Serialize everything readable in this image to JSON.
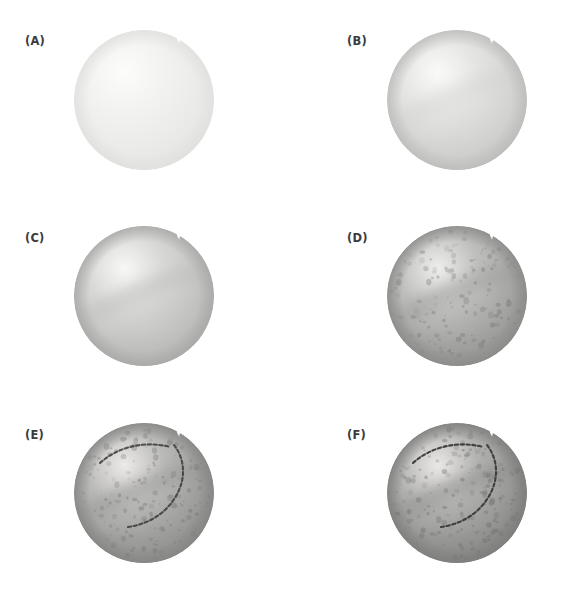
{
  "figure": {
    "kind": "step-by-step-painting-demonstration",
    "medium": "watercolor / grayscale wash",
    "background_color": "#ffffff",
    "label_color": "#3b3b3b",
    "columns": 2,
    "rows": 3,
    "panel_count": 6
  },
  "panels": [
    {
      "id": "A",
      "label": "(A)",
      "label_x": 25,
      "label_y": 36,
      "ball_x": 70,
      "ball_y": 26,
      "stage_description": "palest first wash, flat very light gray sphere with notch",
      "base_color": "#f2f2f0",
      "shadow_color": "#e8e8e6",
      "edge_color": "#e0e0de",
      "highlight_color": "#fcfcfb",
      "seam_opacity": 0.0,
      "speckle_opacity": 0.0,
      "speckle_count": 0,
      "stitch_opacity": 0.0
    },
    {
      "id": "B",
      "label": "(B)",
      "label_x": 347,
      "label_y": 36,
      "ball_x": 383,
      "ball_y": 26,
      "stage_description": "second wash, light gray with soft diagonal seam wash and darker rim",
      "base_color": "#e3e3e1",
      "shadow_color": "#cfcfcd",
      "edge_color": "#bcbcba",
      "highlight_color": "#fafaf9",
      "seam_opacity": 0.28,
      "speckle_opacity": 0.0,
      "speckle_count": 0,
      "stitch_opacity": 0.0
    },
    {
      "id": "C",
      "label": "(C)",
      "label_x": 25,
      "label_y": 233,
      "ball_x": 70,
      "ball_y": 222,
      "stage_description": "third wash, mid-light gray with defined diagonal seam band and form shadow",
      "base_color": "#d6d6d4",
      "shadow_color": "#bdbdbb",
      "edge_color": "#a8a8a6",
      "highlight_color": "#f7f7f6",
      "seam_opacity": 0.42,
      "speckle_opacity": 0.0,
      "speckle_count": 0,
      "stitch_opacity": 0.0
    },
    {
      "id": "D",
      "label": "(D)",
      "label_x": 347,
      "label_y": 233,
      "ball_x": 383,
      "ball_y": 222,
      "stage_description": "mottled leather texture added, darker value with many speckles",
      "base_color": "#bebebc",
      "shadow_color": "#9d9d9b",
      "edge_color": "#8b8b89",
      "highlight_color": "#eeeeec",
      "seam_opacity": 0.42,
      "speckle_opacity": 0.55,
      "speckle_count": 150,
      "stitch_opacity": 0.0
    },
    {
      "id": "E",
      "label": "(E)",
      "label_x": 25,
      "label_y": 430,
      "ball_x": 70,
      "ball_y": 419,
      "stage_description": "stitched seams drawn in dark dashes over textured ball",
      "base_color": "#b8b8b6",
      "shadow_color": "#979795",
      "edge_color": "#858583",
      "highlight_color": "#eceae8",
      "seam_opacity": 0.45,
      "speckle_opacity": 0.6,
      "speckle_count": 165,
      "stitch_opacity": 0.85
    },
    {
      "id": "F",
      "label": "(F)",
      "label_x": 347,
      "label_y": 430,
      "ball_x": 383,
      "ball_y": 419,
      "stage_description": "final stage, deepened shadows, reinforced stitches and richer texture",
      "base_color": "#b2b2b0",
      "shadow_color": "#8f8f8d",
      "edge_color": "#7d7d7b",
      "highlight_color": "#eae8e6",
      "seam_opacity": 0.48,
      "speckle_opacity": 0.68,
      "speckle_count": 185,
      "stitch_opacity": 0.95
    }
  ]
}
